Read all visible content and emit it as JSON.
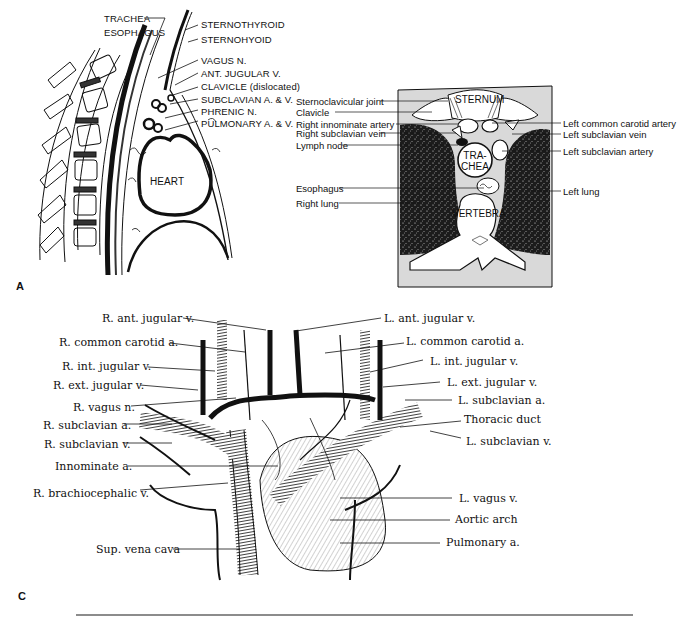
{
  "figure_a": {
    "panel_label": "A",
    "labels": [
      "TRACHEA",
      "ESOPHAGUS",
      "STERNOTHYROID",
      "STERNOHYOID",
      "VAGUS  N.",
      "ANT. JUGULAR  V.",
      "CLAVICLE (dislocated)",
      "SUBCLAVIAN  A. & V.",
      "PHRENIC  N.",
      "PULMONARY  A. & V."
    ],
    "organ_label": "HEART"
  },
  "figure_b": {
    "left_labels": [
      "Sternoclavicular joint",
      "Clavicle",
      "Right innominate artery",
      "Right subclavian vein",
      "Lymph node",
      "Esophagus",
      "Right lung"
    ],
    "right_labels": [
      "Left common carotid artery",
      "Left subclavian vein",
      "Left subclavian artery",
      "Left lung"
    ],
    "inner_labels": {
      "sternum": "STERNUM",
      "trachea_1": "TRA-",
      "trachea_2": "CHEA",
      "vertebra": "VERTEBRA"
    }
  },
  "figure_c": {
    "panel_label": "C",
    "left_labels": [
      "R. ant. jugular v.",
      "R. common carotid a.",
      "R. int. jugular v.",
      "R. ext. jugular v.",
      "R. vagus n.",
      "R. subclavian a.",
      "R. subclavian v.",
      "Innominate a.",
      "R. brachiocephalic v.",
      "Sup. vena cava"
    ],
    "right_labels": [
      "L. ant. jugular v.",
      "L. common carotid a.",
      "L. int. jugular v.",
      "L. ext. jugular v.",
      "L. subclavian a.",
      "Thoracic duct",
      "L. subclavian v.",
      "L. vagus v.",
      "Aortic arch",
      "Pulmonary a."
    ]
  },
  "colors": {
    "ink": "#111111",
    "lung_fill": "#1c1c1c",
    "bg_gray": "#d9d9d9",
    "rule": "#666666"
  }
}
